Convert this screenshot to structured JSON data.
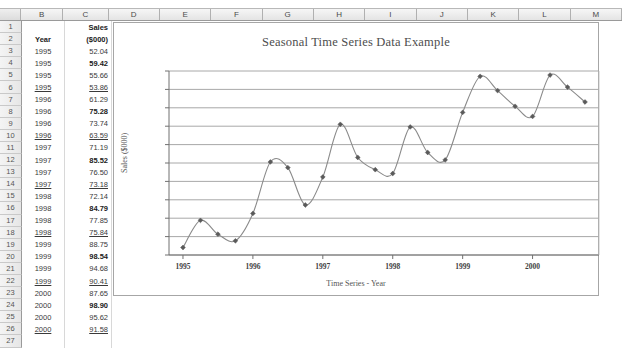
{
  "spreadsheet": {
    "column_headers": [
      "",
      "B",
      "C",
      "D",
      "E",
      "F",
      "G",
      "H",
      "I",
      "J",
      "K",
      "L",
      "M"
    ],
    "row_numbers": [
      "1",
      "2",
      "3",
      "4",
      "5",
      "6",
      "7",
      "8",
      "9",
      "10",
      "11",
      "12",
      "13",
      "14",
      "15",
      "16",
      "17",
      "18",
      "19",
      "20",
      "21",
      "22",
      "23",
      "24",
      "25",
      "26",
      "27"
    ],
    "header_cells": {
      "r1_c": "Sales",
      "r2_b": "Year",
      "r2_c": "($000)"
    },
    "rows": [
      {
        "row": "3",
        "year": "1995",
        "sales": "52.04",
        "bold": false,
        "underline": false
      },
      {
        "row": "4",
        "year": "1995",
        "sales": "59.42",
        "bold": true,
        "underline": false
      },
      {
        "row": "5",
        "year": "1995",
        "sales": "55.66",
        "bold": false,
        "underline": false
      },
      {
        "row": "6",
        "year": "1995",
        "sales": "53.86",
        "bold": false,
        "underline": true
      },
      {
        "row": "7",
        "year": "1996",
        "sales": "61.29",
        "bold": false,
        "underline": false
      },
      {
        "row": "8",
        "year": "1996",
        "sales": "75.28",
        "bold": true,
        "underline": false
      },
      {
        "row": "9",
        "year": "1996",
        "sales": "73.74",
        "bold": false,
        "underline": false
      },
      {
        "row": "10",
        "year": "1996",
        "sales": "63.59",
        "bold": false,
        "underline": true
      },
      {
        "row": "11",
        "year": "1997",
        "sales": "71.19",
        "bold": false,
        "underline": false
      },
      {
        "row": "12",
        "year": "1997",
        "sales": "85.52",
        "bold": true,
        "underline": false
      },
      {
        "row": "13",
        "year": "1997",
        "sales": "76.50",
        "bold": false,
        "underline": false
      },
      {
        "row": "14",
        "year": "1997",
        "sales": "73.18",
        "bold": false,
        "underline": true
      },
      {
        "row": "15",
        "year": "1998",
        "sales": "72.14",
        "bold": false,
        "underline": false
      },
      {
        "row": "16",
        "year": "1998",
        "sales": "84.79",
        "bold": true,
        "underline": false
      },
      {
        "row": "17",
        "year": "1998",
        "sales": "77.85",
        "bold": false,
        "underline": false
      },
      {
        "row": "18",
        "year": "1998",
        "sales": "75.84",
        "bold": false,
        "underline": true
      },
      {
        "row": "19",
        "year": "1999",
        "sales": "88.75",
        "bold": false,
        "underline": false
      },
      {
        "row": "20",
        "year": "1999",
        "sales": "98.54",
        "bold": true,
        "underline": false
      },
      {
        "row": "21",
        "year": "1999",
        "sales": "94.68",
        "bold": false,
        "underline": false
      },
      {
        "row": "22",
        "year": "1999",
        "sales": "90.41",
        "bold": false,
        "underline": true
      },
      {
        "row": "23",
        "year": "2000",
        "sales": "87.65",
        "bold": false,
        "underline": false
      },
      {
        "row": "24",
        "year": "2000",
        "sales": "98.90",
        "bold": true,
        "underline": false
      },
      {
        "row": "25",
        "year": "2000",
        "sales": "95.62",
        "bold": false,
        "underline": false
      },
      {
        "row": "26",
        "year": "2000",
        "sales": "91.58",
        "bold": false,
        "underline": true
      }
    ]
  },
  "chart_data": {
    "type": "line",
    "title": "Seasonal Time Series Data Example",
    "xlabel": "Time Series - Year",
    "ylabel": "Sales ($000)",
    "ylim": [
      50,
      100
    ],
    "ytick_labels": [
      "100.00",
      "95.00",
      "90.00",
      "85.00",
      "80.00",
      "75.00",
      "70.00",
      "65.00",
      "60.00",
      "55.00",
      "50.00"
    ],
    "ytick_values": [
      100,
      95,
      90,
      85,
      80,
      75,
      70,
      65,
      60,
      55,
      50
    ],
    "xtick_labels": [
      "1995",
      "1996",
      "1997",
      "1998",
      "1999",
      "2000"
    ],
    "xtick_values": [
      1,
      5,
      9,
      13,
      17,
      21
    ],
    "grid": true,
    "legend": "none",
    "smooth": true,
    "marker": "diamond",
    "line_color": "#8a8a8a",
    "marker_color": "#5a5a5a",
    "x": [
      1,
      2,
      3,
      4,
      5,
      6,
      7,
      8,
      9,
      10,
      11,
      12,
      13,
      14,
      15,
      16,
      17,
      18,
      19,
      20,
      21,
      22,
      23,
      24
    ],
    "categories": [
      "1995",
      "1995",
      "1995",
      "1995",
      "1996",
      "1996",
      "1996",
      "1996",
      "1997",
      "1997",
      "1997",
      "1997",
      "1998",
      "1998",
      "1998",
      "1998",
      "1999",
      "1999",
      "1999",
      "1999",
      "2000",
      "2000",
      "2000",
      "2000"
    ],
    "values": [
      52.04,
      59.42,
      55.66,
      53.86,
      61.29,
      75.28,
      73.74,
      63.59,
      71.19,
      85.52,
      76.5,
      73.18,
      72.14,
      84.79,
      77.85,
      75.84,
      88.75,
      98.54,
      94.68,
      90.41,
      87.65,
      98.9,
      95.62,
      91.58
    ]
  }
}
